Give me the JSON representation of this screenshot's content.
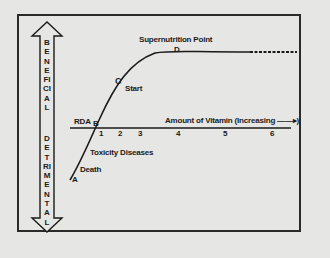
{
  "diagram": {
    "title": "Supernutrition Point",
    "y_axis": {
      "up_label": "BENEFICIAL",
      "down_label": "DETRIMENTAL"
    },
    "x_axis": {
      "label": "Amount of Vitamin (Increasing ——▸)",
      "ticks": [
        "1",
        "2",
        "3",
        "4",
        "5",
        "6"
      ]
    },
    "points": {
      "A": "A",
      "B": "B",
      "C": "C",
      "D": "D"
    },
    "annotations": {
      "rda": "RDA",
      "start": "Start",
      "toxicity": "Toxicity Diseases",
      "death": "Death",
      "supernutrition": "Supernutrition Point"
    },
    "colors": {
      "background": "#e6e6e4",
      "ink": "#1a1a1a"
    }
  }
}
